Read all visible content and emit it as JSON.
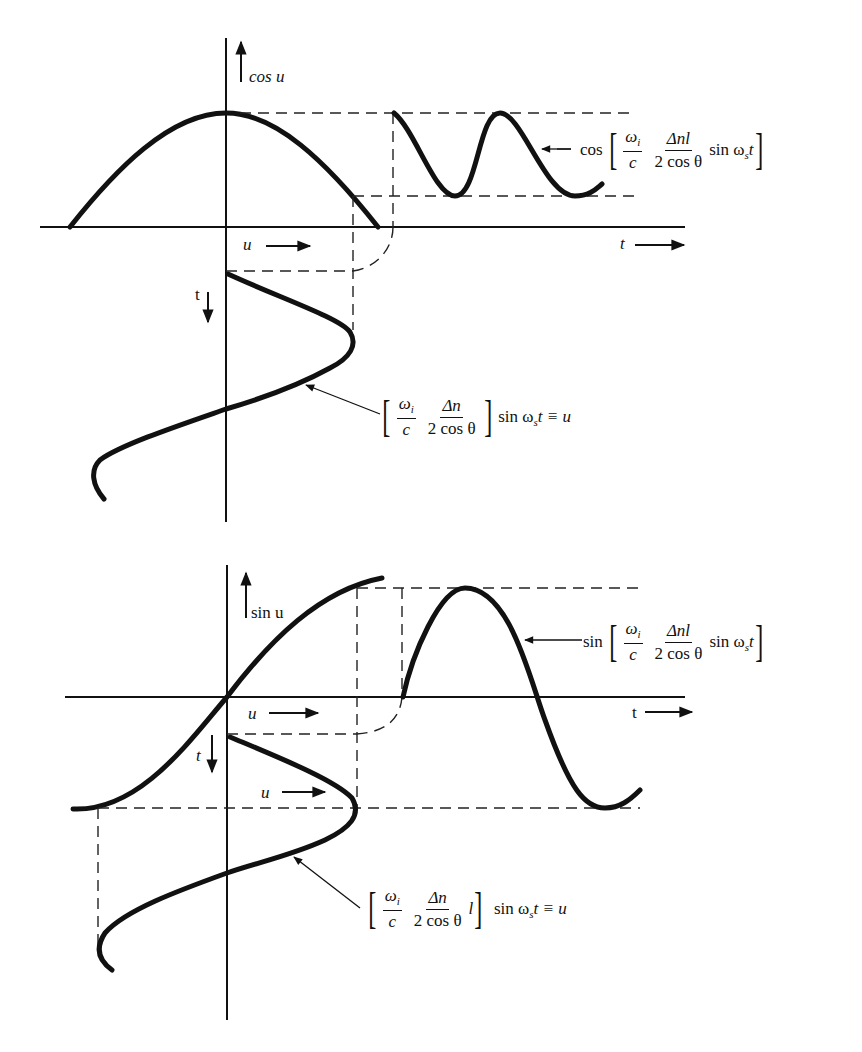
{
  "figure": {
    "top_panel": {
      "y_axis_label": "cos u",
      "u_axis_label": "u",
      "t_axis_label": "t",
      "t_down_label": "t",
      "output_expression": {
        "func": "cos",
        "num1": "ω",
        "num1_sub": "i",
        "den1": "c",
        "num2": "Δnl",
        "den2": "2 cos θ",
        "tail_pre": "sin ω",
        "tail_sub": "s",
        "tail_post": "t"
      },
      "input_expression": {
        "num1": "ω",
        "num1_sub": "i",
        "den1": "c",
        "num2": "Δn",
        "den2": "2 cos θ",
        "tail_pre": "sin ω",
        "tail_sub": "s",
        "tail_post": "t ≡ u"
      }
    },
    "bottom_panel": {
      "y_axis_label": "sin u",
      "u_axis_label": "u",
      "u_axis_label_2": "u",
      "t_axis_label": "t",
      "t_down_label": "t",
      "output_expression": {
        "func": "sin",
        "num1": "ω",
        "num1_sub": "i",
        "den1": "c",
        "num2": "Δnl",
        "den2": "2 cos θ",
        "tail_pre": "sin ω",
        "tail_sub": "s",
        "tail_post": "t"
      },
      "input_expression": {
        "num1": "ω",
        "num1_sub": "i",
        "den1": "c",
        "num2": "Δn",
        "den2": "2 cos θ",
        "extra": "l",
        "tail_pre": "sin ω",
        "tail_sub": "s",
        "tail_post": "t ≡ u"
      }
    }
  },
  "colors": {
    "ink": "#111111",
    "background": "#ffffff"
  }
}
